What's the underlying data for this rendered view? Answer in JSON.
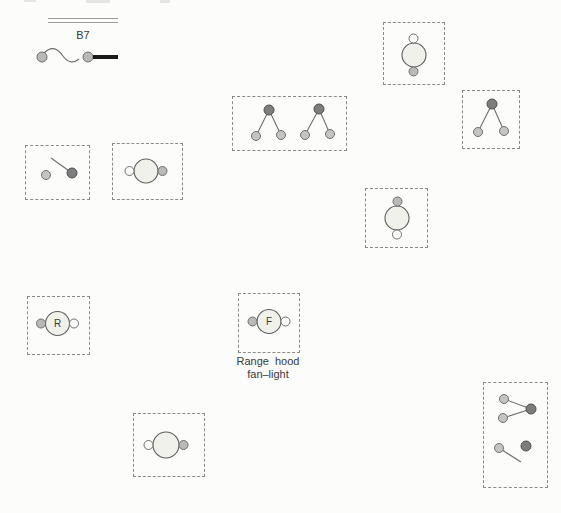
{
  "canvas": {
    "width": 561,
    "height": 513,
    "background": "#fcfcfa"
  },
  "colors": {
    "box_border": "#8a8a8a",
    "large_circle_fill": "#f1f1ec",
    "large_circle_stroke": "#5f5f5f",
    "small_white_circle_fill": "#fcfcfa",
    "small_gray_circle_fill": "#b9b9b5",
    "dark_node_fill": "#7d7d7d",
    "light_node_fill": "#c4c4c0",
    "connector_line": "#6f6f6f",
    "cord_thick_line": "#1a1a1a",
    "text": "#3a3a3a"
  },
  "cable": {
    "label": "B7",
    "symbol": "cord-connector-with-squiggle-and-thick-lead",
    "run_symbol": "double-parallel-line"
  },
  "labels": {
    "receptacle_r": "R",
    "fan_f": "F"
  },
  "caption": {
    "line1": "Range hood",
    "line2": "fan–light"
  },
  "boxes": [
    {
      "id": "box-a",
      "symbol": "lamp-fixture-vertical",
      "small_top": "white",
      "small_bottom": "gray"
    },
    {
      "id": "box-b",
      "symbol": "single-two-lamp-drop",
      "top_node": "dark",
      "bottom_nodes": [
        "light",
        "light"
      ]
    },
    {
      "id": "box-c",
      "symbol": "double-two-lamp-drop",
      "groups": 2,
      "top_node": "dark",
      "bottom_nodes": [
        "light",
        "light"
      ]
    },
    {
      "id": "box-d",
      "symbol": "open-switch",
      "left_node": "light",
      "right_node": "dark",
      "blade": "up-left"
    },
    {
      "id": "box-e",
      "symbol": "lamp-fixture-horizontal",
      "small_left": "white",
      "small_right": "gray"
    },
    {
      "id": "box-f",
      "symbol": "lamp-fixture-vertical",
      "small_top": "gray",
      "small_bottom": "white"
    },
    {
      "id": "box-g",
      "symbol": "lamp-fixture-letter",
      "letter": "R",
      "small_left": "gray",
      "small_right": "white"
    },
    {
      "id": "box-h",
      "symbol": "lamp-fixture-letter",
      "letter": "F",
      "small_left": "gray",
      "small_right": "white",
      "caption": "Range hood fan–light"
    },
    {
      "id": "box-i",
      "symbol": "lamp-fixture-horizontal",
      "small_left": "white",
      "small_right": "gray"
    },
    {
      "id": "box-j",
      "symbol": "junction-group",
      "top_group": "two-light-nodes-joined-to-dark-node",
      "bottom_group": "open-switch-light-to-dark"
    }
  ]
}
